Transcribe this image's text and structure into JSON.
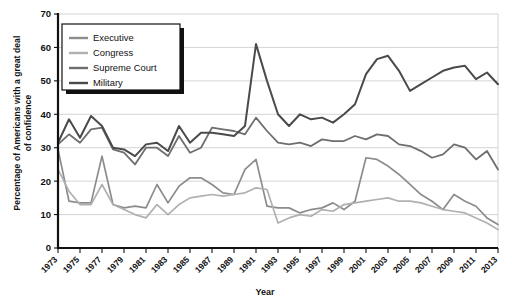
{
  "chart_data": {
    "type": "line",
    "title": "",
    "xlabel": "Year",
    "ylabel": "Percentage of Americans with a great deal of confidence",
    "ylabel_line1": "Percentage of Americans with a great deal",
    "ylabel_line2": "of confidence",
    "ylim": [
      0,
      70
    ],
    "yticks": [
      0,
      10,
      20,
      30,
      40,
      50,
      60,
      70
    ],
    "ytick_labels": [
      "0",
      "10",
      "20",
      "30",
      "40",
      "50",
      "60",
      "70"
    ],
    "xlim": [
      1973,
      2013
    ],
    "grid": true,
    "legend_position": "top-left",
    "x": [
      1973,
      1974,
      1975,
      1976,
      1977,
      1978,
      1979,
      1980,
      1981,
      1982,
      1983,
      1984,
      1985,
      1986,
      1987,
      1988,
      1989,
      1990,
      1991,
      1992,
      1993,
      1994,
      1995,
      1996,
      1997,
      1998,
      1999,
      2000,
      2001,
      2002,
      2003,
      2004,
      2005,
      2006,
      2007,
      2008,
      2009,
      2010,
      2011,
      2012,
      2013
    ],
    "xtick_labels": [
      "1973",
      "1975",
      "1977",
      "1979",
      "1981",
      "1983",
      "1985",
      "1987",
      "1989",
      "1991",
      "1993",
      "1995",
      "1997",
      "1999",
      "2001",
      "2003",
      "2005",
      "2007",
      "2009",
      "2011",
      "2013"
    ],
    "xticks": [
      1973,
      1975,
      1977,
      1979,
      1981,
      1983,
      1985,
      1987,
      1989,
      1991,
      1993,
      1995,
      1997,
      1999,
      2001,
      2003,
      2005,
      2007,
      2009,
      2011,
      2013
    ],
    "series": [
      {
        "name": "Executive",
        "color": "#8c8c8c",
        "width": 1.7,
        "values": [
          29.5,
          14.0,
          13.5,
          13.5,
          27.5,
          13.0,
          12.0,
          12.5,
          12.0,
          19.0,
          13.5,
          18.5,
          21.0,
          21.0,
          19.0,
          16.5,
          16.0,
          23.5,
          26.5,
          12.5,
          12.0,
          12.0,
          10.5,
          11.5,
          12.0,
          13.5,
          11.5,
          14.0,
          27.0,
          26.5,
          24.5,
          22.0,
          19.0,
          16.0,
          14.0,
          11.5,
          16.0,
          14.0,
          12.5,
          9.0,
          7.0
        ]
      },
      {
        "name": "Congress",
        "color": "#b0b0b0",
        "width": 1.7,
        "values": [
          23.5,
          17.0,
          13.0,
          13.0,
          19.0,
          13.0,
          11.5,
          10.0,
          9.0,
          13.0,
          10.0,
          13.0,
          15.0,
          15.5,
          16.0,
          15.5,
          16.0,
          16.5,
          18.0,
          17.5,
          7.5,
          9.0,
          10.0,
          9.5,
          11.5,
          11.0,
          13.0,
          13.5,
          14.0,
          14.5,
          15.0,
          14.0,
          14.0,
          13.5,
          12.5,
          11.5,
          11.0,
          10.5,
          9.0,
          7.5,
          5.5
        ]
      },
      {
        "name": "Supreme Court",
        "color": "#6e6e6e",
        "width": 1.8,
        "values": [
          31.0,
          34.0,
          31.5,
          35.5,
          36.0,
          29.5,
          28.5,
          25.0,
          30.0,
          30.0,
          27.5,
          33.5,
          28.5,
          30.0,
          36.0,
          35.5,
          35.0,
          34.0,
          39.0,
          35.0,
          31.5,
          31.0,
          31.5,
          30.5,
          32.5,
          32.0,
          32.0,
          33.5,
          32.5,
          34.0,
          33.5,
          31.0,
          30.5,
          29.0,
          27.0,
          28.0,
          31.0,
          30.0,
          26.5,
          29.0,
          23.5
        ]
      },
      {
        "name": "Military",
        "color": "#4a4a4a",
        "width": 2.0,
        "values": [
          31.5,
          38.5,
          33.0,
          39.5,
          36.5,
          30.0,
          29.5,
          27.5,
          31.0,
          31.5,
          29.0,
          36.5,
          31.5,
          34.5,
          34.5,
          34.0,
          33.5,
          36.5,
          61.0,
          50.0,
          40.0,
          36.5,
          40.0,
          38.5,
          39.0,
          37.5,
          40.0,
          43.0,
          52.0,
          56.5,
          57.5,
          53.0,
          47.0,
          49.0,
          51.0,
          53.0,
          54.0,
          54.5,
          50.5,
          52.5,
          49.0
        ]
      }
    ]
  },
  "legend": {
    "items": [
      {
        "label": "Executive"
      },
      {
        "label": "Congress"
      },
      {
        "label": "Supreme Court"
      },
      {
        "label": "Military"
      }
    ]
  }
}
